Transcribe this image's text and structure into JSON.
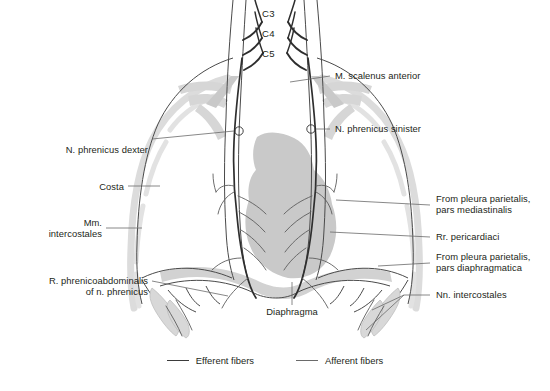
{
  "figure": {
    "colors": {
      "heart_fill": "#c9c9c9",
      "rib_gray": "#d9d9d9",
      "muscle_gray": "#c4c4c4",
      "efferent_line": "#3b3b3b",
      "afferent_line": "#6a6a6a",
      "text": "#231f20",
      "background": "#ffffff"
    }
  },
  "roots": [
    {
      "id": "c3",
      "label": "C3"
    },
    {
      "id": "c4",
      "label": "C4"
    },
    {
      "id": "c5",
      "label": "C5"
    }
  ],
  "labels_left": [
    {
      "id": "n-phrenicus-dexter",
      "text": "N. phrenicus dexter"
    },
    {
      "id": "costa",
      "text": "Costa"
    },
    {
      "id": "mm-intercostales",
      "text": "Mm.\nintercostales"
    },
    {
      "id": "r-phrenicoabdominalis",
      "text": "R. phrenicoabdominalis\nof n. phrenicus"
    }
  ],
  "labels_right": [
    {
      "id": "m-scalenus-anterior",
      "text": "M. scalenus anterior"
    },
    {
      "id": "n-phrenicus-sinister",
      "text": "N. phrenicus sinister"
    },
    {
      "id": "pleura-mediastinalis",
      "text": "From pleura parietalis,\npars mediastinalis"
    },
    {
      "id": "rr-pericardiaci",
      "text": "Rr. pericardiaci"
    },
    {
      "id": "pleura-diaphragmatica",
      "text": "From pleura parietalis,\npars diaphragmatica"
    },
    {
      "id": "nn-intercostales",
      "text": "Nn. intercostales"
    }
  ],
  "labels_center": [
    {
      "id": "diaphragma",
      "text": "Diaphragma"
    }
  ],
  "legend": [
    {
      "id": "efferent",
      "text": "Efferent fibers"
    },
    {
      "id": "afferent",
      "text": "Afferent fibers"
    }
  ]
}
